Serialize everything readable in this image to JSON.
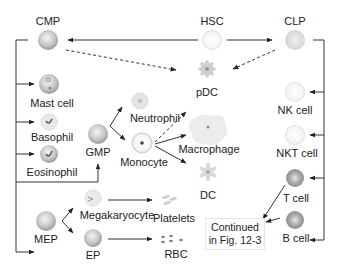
{
  "nodes": {
    "hsc": {
      "label": "HSC"
    },
    "cmp": {
      "label": "CMP"
    },
    "clp": {
      "label": "CLP"
    },
    "pdc": {
      "label": "pDC"
    },
    "mast_cell": {
      "label": "Mast cell"
    },
    "basophil": {
      "label": "Basophil"
    },
    "eosinophil": {
      "label": "Eosinophil"
    },
    "gmp": {
      "label": "GMP"
    },
    "neutrophil": {
      "label": "Neutrophil"
    },
    "monocyte": {
      "label": "Monocyte"
    },
    "macrophage": {
      "label": "Macrophage"
    },
    "dc": {
      "label": "DC"
    },
    "mep": {
      "label": "MEP"
    },
    "megakaryocyte": {
      "label": "Megakaryocyte"
    },
    "platelets": {
      "label": "Platelets"
    },
    "ep": {
      "label": "EP"
    },
    "rbc": {
      "label": "RBC"
    },
    "nk_cell": {
      "label": "NK cell"
    },
    "nkt_cell": {
      "label": "NKT cell"
    },
    "t_cell": {
      "label": "T cell"
    },
    "b_cell": {
      "label": "B cell"
    }
  },
  "note": {
    "line1": "Continued",
    "line2": "in Fig. 12-3"
  },
  "edges": [
    {
      "from": "HSC",
      "to": "CMP",
      "style": "solid"
    },
    {
      "from": "HSC",
      "to": "CLP",
      "style": "solid"
    },
    {
      "from": "CMP",
      "to": "pDC",
      "style": "dashed"
    },
    {
      "from": "CLP",
      "to": "pDC",
      "style": "dashed"
    },
    {
      "from": "CMP",
      "to": "Mast cell",
      "style": "solid"
    },
    {
      "from": "CMP",
      "to": "Basophil",
      "style": "solid"
    },
    {
      "from": "CMP",
      "to": "Eosinophil",
      "style": "solid"
    },
    {
      "from": "CMP",
      "to": "GMP",
      "style": "solid"
    },
    {
      "from": "CMP",
      "to": "MEP",
      "style": "solid"
    },
    {
      "from": "GMP",
      "to": "Neutrophil",
      "style": "solid"
    },
    {
      "from": "GMP",
      "to": "Monocyte",
      "style": "solid"
    },
    {
      "from": "Monocyte",
      "to": "pDC",
      "style": "dashed"
    },
    {
      "from": "Monocyte",
      "to": "Macrophage",
      "style": "solid"
    },
    {
      "from": "Monocyte",
      "to": "DC",
      "style": "solid"
    },
    {
      "from": "MEP",
      "to": "Megakaryocyte",
      "style": "solid"
    },
    {
      "from": "MEP",
      "to": "EP",
      "style": "solid"
    },
    {
      "from": "Megakaryocyte",
      "to": "Platelets",
      "style": "solid"
    },
    {
      "from": "EP",
      "to": "RBC",
      "style": "solid"
    },
    {
      "from": "CLP",
      "to": "NK cell",
      "style": "solid"
    },
    {
      "from": "CLP",
      "to": "NKT cell",
      "style": "solid"
    },
    {
      "from": "CLP",
      "to": "T cell",
      "style": "solid"
    },
    {
      "from": "CLP",
      "to": "B cell",
      "style": "solid"
    },
    {
      "from": "T cell",
      "to": "Continued in Fig. 12-3",
      "style": "solid"
    },
    {
      "from": "B cell",
      "to": "Continued in Fig. 12-3",
      "style": "solid"
    }
  ]
}
